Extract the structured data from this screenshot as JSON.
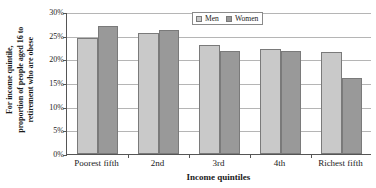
{
  "chart_data": {
    "type": "bar",
    "title": "",
    "xlabel": "Income quintiles",
    "ylabel": "For income quintile, proportion of people aged 16 to retirement who are obese",
    "ylabel_lines": [
      "For income quintile,",
      "proportion of people aged 16 to",
      "retirement who are obese"
    ],
    "categories": [
      "Poorest fifth",
      "2nd",
      "3rd",
      "4th",
      "Richest fifth"
    ],
    "series": [
      {
        "name": "Men",
        "values": [
          24.6,
          25.5,
          23.1,
          22.1,
          21.5
        ],
        "color": "#c9c9c9"
      },
      {
        "name": "Women",
        "values": [
          27.0,
          26.2,
          21.7,
          21.8,
          16.1
        ],
        "color": "#999999"
      }
    ],
    "ylim": [
      0,
      30
    ],
    "ytick_values": [
      0,
      5,
      10,
      15,
      20,
      25,
      30
    ],
    "ytick_labels": [
      "0%",
      "5%",
      "10%",
      "15%",
      "20%",
      "25%",
      "30%"
    ],
    "grid": true,
    "legend_position": "top-right",
    "legend_entries": [
      "Men",
      "Women"
    ]
  },
  "legend": {
    "men_label": "Men",
    "women_label": "Women"
  }
}
